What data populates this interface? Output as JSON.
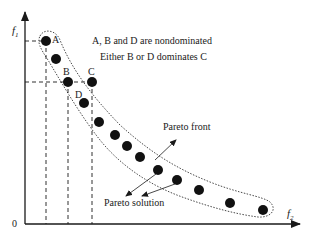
{
  "diagram": {
    "type": "pareto-front",
    "axes": {
      "y_label": "f",
      "y_sub": "1",
      "x_label": "f",
      "x_sub": "2",
      "origin_label": "0"
    },
    "annotations": {
      "line1": "A, B and D are nondominated",
      "line2": "Either B or D dominates C",
      "pareto_front": "Pareto front",
      "pareto_solution": "Pareto solution"
    },
    "point_labels": {
      "A": "A",
      "B": "B",
      "C": "C",
      "D": "D"
    },
    "points": [
      {
        "id": "A",
        "x": 46,
        "y": 41
      },
      {
        "id": "p2",
        "x": 56,
        "y": 59
      },
      {
        "id": "B",
        "x": 68,
        "y": 82
      },
      {
        "id": "C",
        "x": 92,
        "y": 82
      },
      {
        "id": "D",
        "x": 84,
        "y": 103
      },
      {
        "id": "p6",
        "x": 99,
        "y": 122
      },
      {
        "id": "p7",
        "x": 115,
        "y": 135
      },
      {
        "id": "p8",
        "x": 127,
        "y": 146
      },
      {
        "id": "p9",
        "x": 140,
        "y": 157
      },
      {
        "id": "p10",
        "x": 158,
        "y": 170
      },
      {
        "id": "p11",
        "x": 177,
        "y": 180
      },
      {
        "id": "p12",
        "x": 199,
        "y": 190
      },
      {
        "id": "p13",
        "x": 230,
        "y": 203
      },
      {
        "id": "p14",
        "x": 263,
        "y": 210
      }
    ],
    "colors": {
      "ink": "#1a1a1a",
      "background": "#ffffff"
    }
  }
}
